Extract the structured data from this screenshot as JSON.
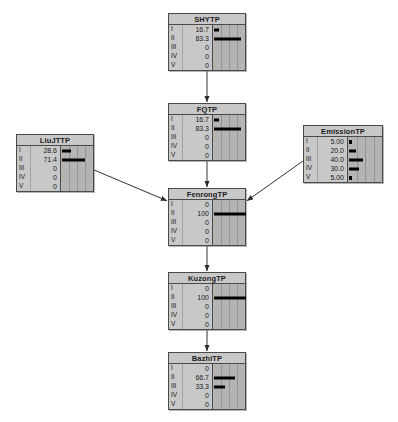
{
  "diagram": {
    "type": "bayesian-network",
    "state_labels": [
      "I",
      "II",
      "III",
      "IV",
      "V"
    ],
    "nodes": [
      {
        "id": "shytp",
        "title": "SHYTP",
        "x": 168,
        "y": 13,
        "w": 78,
        "h": 58,
        "values": [
          "16.7",
          "83.3",
          "0",
          "0",
          "0"
        ],
        "percents": [
          16.7,
          83.3,
          0,
          0,
          0
        ]
      },
      {
        "id": "fqtp",
        "title": "FQTP",
        "x": 168,
        "y": 103,
        "w": 78,
        "h": 58,
        "values": [
          "16.7",
          "83.3",
          "0",
          "0",
          "0"
        ],
        "percents": [
          16.7,
          83.3,
          0,
          0,
          0
        ]
      },
      {
        "id": "liujttp",
        "title": "LiuJTTP",
        "x": 16,
        "y": 134,
        "w": 78,
        "h": 58,
        "values": [
          "28.6",
          "71.4",
          "0",
          "0",
          "0"
        ],
        "percents": [
          28.6,
          71.4,
          0,
          0,
          0
        ]
      },
      {
        "id": "emissiontp",
        "title": "EmissionTP",
        "x": 303,
        "y": 125,
        "w": 80,
        "h": 58,
        "values": [
          "5.00",
          "20.0",
          "40.0",
          "30.0",
          "5.00"
        ],
        "percents": [
          5.0,
          20.0,
          40.0,
          30.0,
          5.0
        ]
      },
      {
        "id": "fenrongtp",
        "title": "FenrongTP",
        "x": 168,
        "y": 188,
        "w": 78,
        "h": 58,
        "values": [
          "0",
          "100",
          "0",
          "0",
          "0"
        ],
        "percents": [
          0,
          100,
          0,
          0,
          0
        ]
      },
      {
        "id": "kuzongtp",
        "title": "KuzongTP",
        "x": 168,
        "y": 272,
        "w": 78,
        "h": 58,
        "values": [
          "0",
          "100",
          "0",
          "0",
          "0"
        ],
        "percents": [
          0,
          100,
          0,
          0,
          0
        ]
      },
      {
        "id": "bazhitp",
        "title": "BazhiTP",
        "x": 168,
        "y": 352,
        "w": 78,
        "h": 58,
        "values": [
          "0",
          "66.7",
          "33.3",
          "0",
          "0"
        ],
        "percents": [
          0,
          66.7,
          33.3,
          0,
          0
        ]
      }
    ],
    "edges": [
      {
        "from": "shytp",
        "to": "fqtp",
        "kind": "vertical"
      },
      {
        "from": "fqtp",
        "to": "fenrongtp",
        "kind": "vertical"
      },
      {
        "from": "liujttp",
        "to": "fenrongtp",
        "kind": "diagonal"
      },
      {
        "from": "emissiontp",
        "to": "fenrongtp",
        "kind": "diagonal"
      },
      {
        "from": "fenrongtp",
        "to": "kuzongtp",
        "kind": "vertical"
      },
      {
        "from": "kuzongtp",
        "to": "bazhitp",
        "kind": "vertical"
      }
    ],
    "colors": {
      "node_fill": "#c8c8c8",
      "node_border": "#4a4a4a",
      "chart_fill": "#b4b4b4",
      "gridline": "#949494",
      "bar": "#000000",
      "edge": "#333333",
      "background": "#ffffff"
    }
  },
  "chart_data": {
    "type": "bar",
    "xlabel": "",
    "ylabel": "State",
    "categories": [
      "I",
      "II",
      "III",
      "IV",
      "V"
    ],
    "xlim": [
      0,
      100
    ],
    "grid": true,
    "legend": "none",
    "orientation": "horizontal",
    "series": [
      {
        "name": "SHYTP",
        "values": [
          16.7,
          83.3,
          0,
          0,
          0
        ]
      },
      {
        "name": "FQTP",
        "values": [
          16.7,
          83.3,
          0,
          0,
          0
        ]
      },
      {
        "name": "LiuJTTP",
        "values": [
          28.6,
          71.4,
          0,
          0,
          0
        ]
      },
      {
        "name": "EmissionTP",
        "values": [
          5.0,
          20.0,
          40.0,
          30.0,
          5.0
        ]
      },
      {
        "name": "FenrongTP",
        "values": [
          0,
          100,
          0,
          0,
          0
        ]
      },
      {
        "name": "KuzongTP",
        "values": [
          0,
          100,
          0,
          0,
          0
        ]
      },
      {
        "name": "BazhiTP",
        "values": [
          0,
          66.7,
          33.3,
          0,
          0
        ]
      }
    ]
  }
}
